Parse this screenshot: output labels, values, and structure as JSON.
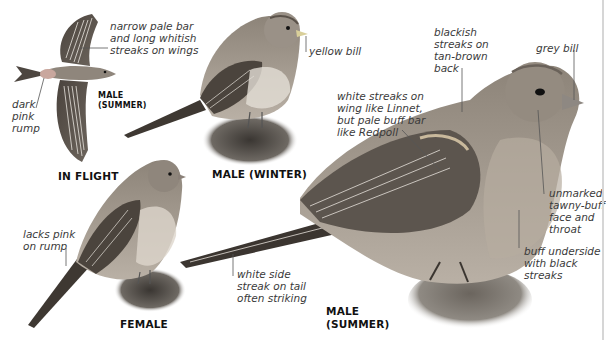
{
  "figure": {
    "views": [
      {
        "id": "in_flight",
        "caption": "IN FLIGHT",
        "sub_caption": "MALE\n(SUMMER)"
      },
      {
        "id": "male_winter",
        "caption": "MALE (WINTER)"
      },
      {
        "id": "female",
        "caption": "FEMALE"
      },
      {
        "id": "male_summer",
        "caption": "MALE\n(SUMMER)"
      }
    ],
    "annotations": {
      "flight_wings": "narrow pale bar\nand long whitish\nstreaks on wings",
      "flight_rump": "dark\npink\nrump",
      "winter_bill": "yellow bill",
      "female_rump": "lacks pink\non rump",
      "summer_back": "blackish\nstreaks on\ntan-brown\nback",
      "summer_bill": "grey bill",
      "summer_wing": "white streaks on\nwing like Linnet,\nbut pale buff bar\nlike Redpoll",
      "summer_face": "unmarked\ntawny-buff\nface and\nthroat",
      "summer_underside": "buff underside\nwith black\nstreaks",
      "summer_tail": "white side\nstreak on tail\noften striking"
    },
    "colors": {
      "background": "#ffffff",
      "text": "#3a3a3a",
      "caption": "#111111",
      "bird_dark": "#3b3530",
      "bird_mid": "#8a8076",
      "bird_light": "#cfc6bb",
      "rump_pink": "#c9a79e",
      "rule": "#d6d6d6"
    }
  }
}
